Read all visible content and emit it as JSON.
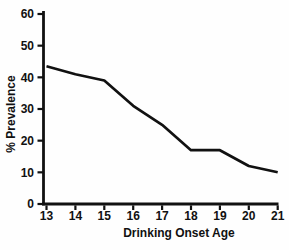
{
  "chart_data": {
    "type": "line",
    "title": "",
    "xlabel": "Drinking Onset Age",
    "ylabel": "% Prevalence",
    "x": [
      13,
      14,
      15,
      16,
      17,
      18,
      19,
      20,
      21
    ],
    "values": [
      43.5,
      41,
      39,
      31,
      25,
      17,
      17,
      12,
      10
    ],
    "x_ticks": [
      "13",
      "14",
      "15",
      "16",
      "17",
      "18",
      "19",
      "20",
      "21"
    ],
    "y_ticks": [
      "0",
      "10",
      "20",
      "30",
      "40",
      "50",
      "60"
    ],
    "y_tick_values": [
      0,
      10,
      20,
      30,
      40,
      50,
      60
    ],
    "xlim": [
      13,
      21
    ],
    "ylim": [
      0,
      60
    ],
    "grid": false,
    "legend": false,
    "line_color": "#111111",
    "axis_color": "#111111",
    "background": "#fefefe"
  }
}
